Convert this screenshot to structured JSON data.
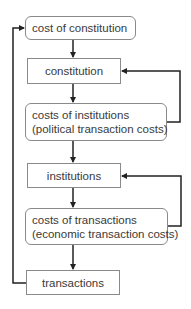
{
  "diagram": {
    "nodes": [
      {
        "id": "cost-of-constitution",
        "lines": [
          "cost of constitution"
        ],
        "shape": "rounded"
      },
      {
        "id": "constitution",
        "lines": [
          "constitution"
        ],
        "shape": "rectangle"
      },
      {
        "id": "costs-of-institutions",
        "lines": [
          "costs of institutions",
          "(political transaction costs)"
        ],
        "shape": "rounded"
      },
      {
        "id": "institutions",
        "lines": [
          "institutions"
        ],
        "shape": "rectangle"
      },
      {
        "id": "costs-of-transactions",
        "lines": [
          "costs of transactions",
          "(economic transaction costs)"
        ],
        "shape": "rounded"
      },
      {
        "id": "transactions",
        "lines": [
          "transactions"
        ],
        "shape": "rectangle"
      }
    ],
    "edges": [
      {
        "from": "cost-of-constitution",
        "to": "constitution"
      },
      {
        "from": "constitution",
        "to": "costs-of-institutions"
      },
      {
        "from": "costs-of-institutions",
        "to": "institutions"
      },
      {
        "from": "institutions",
        "to": "costs-of-transactions"
      },
      {
        "from": "costs-of-transactions",
        "to": "transactions"
      },
      {
        "from": "costs-of-institutions",
        "to": "constitution",
        "kind": "feedback-right"
      },
      {
        "from": "costs-of-transactions",
        "to": "institutions",
        "kind": "feedback-right"
      },
      {
        "from": "transactions",
        "to": "cost-of-constitution",
        "kind": "feedback-left"
      }
    ],
    "colors": {
      "line": "#222222",
      "border": "#8a8a8a",
      "text": "#3a3a3a"
    }
  }
}
